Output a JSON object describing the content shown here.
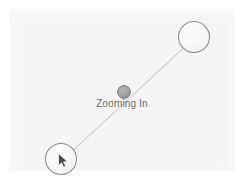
{
  "diagram": {
    "title": "Zooming In",
    "caption_label": "Zooming In",
    "surface": {
      "name": "gesture-surface",
      "background_color": "#f3f3f3",
      "border_color": "#ffffff"
    },
    "colors": {
      "surface": "#f3f3f3",
      "touch_circle_fill": "#f7f7f7",
      "touch_circle_stroke": "#8c8c8c",
      "midpoint_dot_fill": "#9e9e9e",
      "midpoint_dot_stroke": "#7a7a7a",
      "connector_line": "#b9b9b9",
      "caption_text": "#6b6b6b",
      "cursor_fill": "#4a4a4a",
      "cursor_stroke": "#ffffff"
    },
    "connector": {
      "name": "pinch-path-line",
      "x1": 65,
      "y1": 158,
      "x2": 190,
      "y2": 42,
      "stroke_width": 0.9
    },
    "touch_points": [
      {
        "id": "touch-point-top-right",
        "label": "",
        "cx": 194,
        "cy": 37,
        "r": 15.5
      },
      {
        "id": "touch-point-bottom-left",
        "label": "",
        "cx": 61,
        "cy": 159,
        "r": 15.5
      }
    ],
    "midpoint": {
      "id": "zoom-center-dot",
      "cx": 124,
      "cy": 92,
      "r": 6.5
    },
    "cursor": {
      "id": "mouse-cursor",
      "x": 60,
      "y": 155,
      "label": "mouse-pointer"
    }
  }
}
